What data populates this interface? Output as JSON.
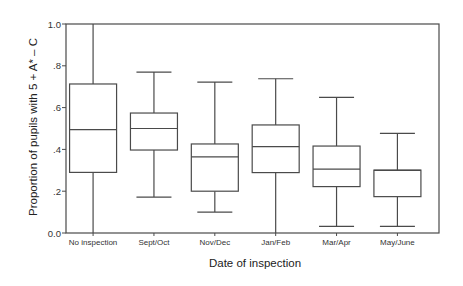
{
  "chart_data": {
    "type": "boxplot",
    "title": "",
    "xlabel": "Date of inspection",
    "ylabel": "Proportion of pupils with 5 + A* – C",
    "ylim": [
      0,
      1
    ],
    "yticks": [
      0,
      0.2,
      0.4,
      0.6,
      0.8,
      1.0
    ],
    "ytick_labels": [
      "0.0",
      ".2",
      ".4",
      ".6",
      ".8",
      "1.0"
    ],
    "grid": false,
    "legend": null,
    "categories": [
      "No inspection",
      "Sept/Oct",
      "Nov/Dec",
      "Jan/Feb",
      "Mar/Apr",
      "May/June"
    ],
    "boxes": [
      {
        "label": "No inspection",
        "min": 0.0,
        "q1": 0.29,
        "median": 0.495,
        "q3": 0.713,
        "max": 1.0
      },
      {
        "label": "Sept/Oct",
        "min": 0.172,
        "q1": 0.397,
        "median": 0.5,
        "q3": 0.574,
        "max": 0.77
      },
      {
        "label": "Nov/Dec",
        "min": 0.1,
        "q1": 0.2,
        "median": 0.364,
        "q3": 0.426,
        "max": 0.722
      },
      {
        "label": "Jan/Feb",
        "min": 0.0,
        "q1": 0.289,
        "median": 0.413,
        "q3": 0.517,
        "max": 0.738
      },
      {
        "label": "Mar/Apr",
        "min": 0.032,
        "q1": 0.222,
        "median": 0.306,
        "q3": 0.416,
        "max": 0.649
      },
      {
        "label": "May/June",
        "min": 0.032,
        "q1": 0.174,
        "median": 0.3,
        "q3": 0.301,
        "max": 0.477
      }
    ]
  },
  "style": {
    "line_color": "#4a4a4a",
    "background": "#ffffff"
  }
}
